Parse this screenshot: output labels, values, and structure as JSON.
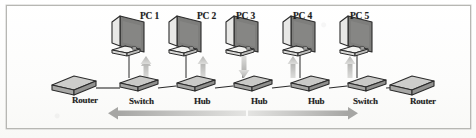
{
  "figure": {
    "kind": "network-topology-diagram",
    "border_color": "#b7b7b3",
    "background_color": "#fdfdfc",
    "ink_color": "#1d1d1d",
    "device_fill": "#c9c9c7",
    "device_shade": "#9d9d9b",
    "arrow_color": "#bdbdbb"
  },
  "workstations": [
    {
      "label": "PC 1",
      "x": 112,
      "y": 18
    },
    {
      "label": "PC 2",
      "x": 169,
      "y": 18
    },
    {
      "label": "PC 3",
      "x": 226,
      "y": 18
    },
    {
      "label": "PC 4",
      "x": 283,
      "y": 18
    },
    {
      "label": "PC 5",
      "x": 340,
      "y": 18
    }
  ],
  "devices": [
    {
      "label": "Router",
      "type": "router",
      "x": 78,
      "y": 82
    },
    {
      "label": "Switch",
      "type": "switch",
      "x": 131,
      "y": 80
    },
    {
      "label": "Hub",
      "type": "hub",
      "x": 188,
      "y": 80
    },
    {
      "label": "Hub",
      "type": "hub",
      "x": 245,
      "y": 80
    },
    {
      "label": "Hub",
      "type": "hub",
      "x": 302,
      "y": 80
    },
    {
      "label": "Switch",
      "type": "switch",
      "x": 359,
      "y": 80
    },
    {
      "label": "Router",
      "type": "router",
      "x": 411,
      "y": 82
    }
  ],
  "vertical_arrows": [
    {
      "for": "PC 1",
      "direction": "up"
    },
    {
      "for": "PC 2",
      "direction": "up"
    },
    {
      "for": "PC 3",
      "direction": "down"
    },
    {
      "for": "PC 4",
      "direction": "up"
    },
    {
      "for": "PC 5",
      "direction": "up"
    }
  ],
  "flow_arrows": [
    {
      "name": "left-flow-arrow",
      "direction": "left",
      "x1": 246,
      "x2": 110,
      "y": 113
    },
    {
      "name": "right-flow-arrow",
      "direction": "right",
      "x1": 248,
      "x2": 358,
      "y": 113
    }
  ]
}
